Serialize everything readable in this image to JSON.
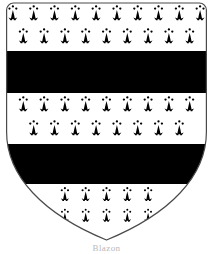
{
  "image": {
    "kind": "heraldic-coat-of-arms",
    "title": "Coat of arms shield",
    "width": 213,
    "height": 254,
    "background_color": "#ffffff"
  },
  "caption": {
    "text": "Blazon"
  },
  "shield": {
    "name": "heater-shield",
    "field_tincture_label": "Ermine",
    "field_color": "#ffffff",
    "charge_color": "#000000",
    "outline_color": "#4a4a4a",
    "outline_width": 1.2,
    "geometry": {
      "left": 6,
      "right": 207,
      "top": 3,
      "point_y": 240,
      "shoulder_y": 150,
      "corner_radius": 7
    }
  },
  "ordinaries": [
    {
      "name": "fess-upper",
      "label": "Bar (sable)",
      "color": "#000000",
      "y_top": 51,
      "y_bottom": 93
    },
    {
      "name": "fess-lower",
      "label": "Bar (sable)",
      "color": "#000000",
      "y_top": 144,
      "y_bottom": 184
    }
  ],
  "ermine_rows": [
    {
      "name": "ermine-row-1",
      "y": 16,
      "count": 10,
      "spacing": 20.8,
      "offset": 0,
      "scale": 1.0
    },
    {
      "name": "ermine-row-2",
      "y": 39,
      "count": 9,
      "spacing": 20.8,
      "offset": 10.4,
      "scale": 1.0
    },
    {
      "name": "ermine-row-3",
      "y": 107,
      "count": 9,
      "spacing": 20.8,
      "offset": 10.4,
      "scale": 1.0
    },
    {
      "name": "ermine-row-4",
      "y": 131,
      "count": 8,
      "spacing": 20.8,
      "offset": 20.8,
      "scale": 1.0
    },
    {
      "name": "ermine-row-5",
      "y": 197,
      "count": 5,
      "spacing": 20.8,
      "offset": 31.2,
      "scale": 0.92
    },
    {
      "name": "ermine-row-6",
      "y": 218,
      "count": 5,
      "spacing": 20.8,
      "offset": 41.6,
      "scale": 0.86
    }
  ],
  "ermine_spot": {
    "name": "ermine-spot",
    "label": "Ermine spot",
    "color": "#000000",
    "dot_radius": 1.15,
    "tail_height": 14,
    "tail_half_width": 4.4
  }
}
